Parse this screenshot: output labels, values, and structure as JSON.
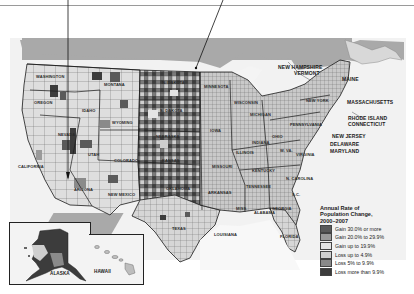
{
  "map": {
    "title": "Annual Rate of Population Change, 2000–2007",
    "region": "United States (county level)",
    "labels": {
      "washington": "WASHINGTON",
      "oregon": "OREGON",
      "idaho": "IDAHO",
      "montana": "MONTANA",
      "wyoming": "WYOMING",
      "nevada": "NEVADA",
      "utah": "UTAH",
      "california": "CALIFORNIA",
      "arizona": "ARIZONA",
      "colorado": "COLORADO",
      "new_mexico": "NEW MEXICO",
      "north_dakota": "N. DAKOTA",
      "south_dakota": "S. DAKOTA",
      "nebraska": "NEBRASKA",
      "kansas": "KANSAS",
      "oklahoma": "OKLAHOMA",
      "texas": "TEXAS",
      "minnesota": "MINNESOTA",
      "iowa": "IOWA",
      "missouri": "MISSOURI",
      "arkansas": "ARKANSAS",
      "louisiana": "LOUISIANA",
      "wisconsin": "WISCONSIN",
      "illinois": "ILLINOIS",
      "michigan": "MICHIGAN",
      "indiana": "INDIANA",
      "ohio": "OHIO",
      "kentucky": "KENTUCKY",
      "tennessee": "TENNESSEE",
      "mississippi": "MISS.",
      "alabama": "ALABAMA",
      "georgia": "GEORGIA",
      "florida": "FLORIDA",
      "south_carolina": "S.C.",
      "north_carolina": "N. CAROLINA",
      "virginia": "VIRGINIA",
      "west_virginia": "W. VA.",
      "pennsylvania": "PENNSYLVANIA",
      "new_york": "NEW YORK",
      "maine": "MAINE",
      "new_hampshire": "NEW HAMPSHIRE",
      "vermont": "VERMONT",
      "massachusetts": "MASSACHUSETTS",
      "rhode_island": "RHODE ISLAND",
      "connecticut": "CONNECTICUT",
      "new_jersey": "NEW JERSEY",
      "delaware": "DELAWARE",
      "maryland": "MARYLAND",
      "alaska": "ALASKA",
      "hawaii": "HAWAII"
    }
  },
  "legend": {
    "title_line1": "Annual Rate of",
    "title_line2": "Population Change,",
    "title_line3": "2000–2007",
    "items": [
      {
        "label": "Gain 30.0% or more",
        "color": "#5a5a5a"
      },
      {
        "label": "Gain 20.0% to 29.9%",
        "color": "#9a9a9a"
      },
      {
        "label": "Gain up to 19.9%",
        "color": "#e4e4e4"
      },
      {
        "label": "Loss up to 4.9%",
        "color": "#d0d0d0"
      },
      {
        "label": "Loss 5% to 9.9%",
        "color": "#8a8a8a"
      },
      {
        "label": "Loss more than 9.9%",
        "color": "#3c3c3c"
      }
    ]
  },
  "colors": {
    "water": "#a9a9a9",
    "land_background": "#f2f2f2",
    "border": "#1a1a1a"
  }
}
